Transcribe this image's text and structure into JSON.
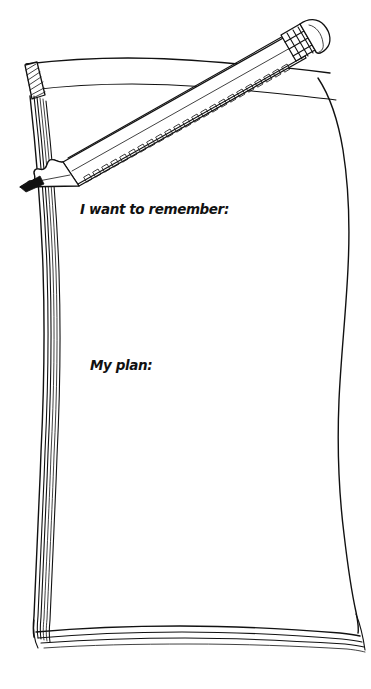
{
  "document": {
    "kind": "worksheet",
    "title": "Notepad with Pencil",
    "medium": "pen-and-ink line drawing",
    "canvas": {
      "width": 371,
      "height": 689
    },
    "background_color": "#ffffff",
    "ink_color": "#111111"
  },
  "prompts": [
    {
      "id": "remember",
      "label": "I want to remember:",
      "x": 80,
      "y": 214,
      "answer_value": "",
      "placeholder": ""
    },
    {
      "id": "plan",
      "label": "My plan:",
      "x": 90,
      "y": 370,
      "answer_value": "",
      "placeholder": ""
    }
  ],
  "illustration": {
    "notepad": {
      "name": "notepad",
      "description": "hand-drawn pad of paper with stacked page edges",
      "binding_corner": "hatched block at top-left",
      "spine_line_count": 6,
      "bottom_page_line_count": 4
    },
    "pencil": {
      "name": "pencil",
      "description": "sharpened wooden pencil lying diagonally across the pad",
      "tip_point": [
        20,
        186
      ],
      "eraser_point": [
        312,
        44
      ],
      "parts": [
        "graphite-point",
        "sharpened-wood-cone",
        "barrel",
        "barrel-shading-band",
        "metal-ferrule",
        "eraser-cap"
      ]
    }
  },
  "icon_names": {
    "pencil": "pencil-icon",
    "notepad": "notepad-icon",
    "eraser": "eraser-icon",
    "ferrule": "ferrule-icon",
    "graphite_tip": "pencil-tip-icon"
  }
}
